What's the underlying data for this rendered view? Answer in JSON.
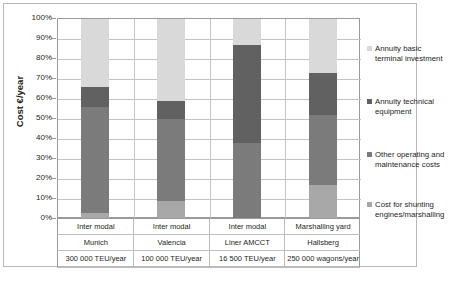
{
  "chart_data": {
    "type": "bar",
    "subtype": "stacked-percentage",
    "title": "",
    "xlabel": "",
    "ylabel": "Cost €/year",
    "ylim": [
      0,
      100
    ],
    "ytick_labels": [
      "100%",
      "90%",
      "80%",
      "70%",
      "60%",
      "50%",
      "40%",
      "30%",
      "20%",
      "10%",
      "0%"
    ],
    "ytick_values": [
      100,
      90,
      80,
      70,
      60,
      50,
      40,
      30,
      20,
      10,
      0
    ],
    "grid": true,
    "legend_position": "right",
    "categories": [
      {
        "line1": "Inter modal",
        "line2": "Munich",
        "line3": "300 000 TEU/year"
      },
      {
        "line1": "Inter modal",
        "line2": "Valencia",
        "line3": "100 000 TEU/year"
      },
      {
        "line1": "Inter modal",
        "line2": "Liner AMCCT",
        "line3": "16 500 TEU/year"
      },
      {
        "line1": "Marshalling yard",
        "line2": "Hallsberg",
        "line3": "250 000 wagons/year"
      }
    ],
    "series": [
      {
        "name": "Cost for shunting engines/marshalling",
        "color": "#b3b3b3",
        "values": [
          3,
          9,
          0,
          17
        ]
      },
      {
        "name": "Other operating and maintenance costs",
        "color": "#7f7f7f",
        "values": [
          63,
          50,
          38,
          35
        ]
      },
      {
        "name": "Annuity technical equipment",
        "color": "#595959",
        "values": [
          0,
          0,
          0,
          0
        ]
      },
      {
        "name": "Annuity basic terminal investment",
        "color": "#d9d9d9",
        "values": [
          34,
          41,
          13,
          27
        ]
      }
    ],
    "bars": [
      {
        "category": "Inter modal Munich",
        "x": 80,
        "segments": [
          {
            "label": "Annuity basic terminal investment",
            "from": 66,
            "to": 100,
            "color": "#d9d9d9"
          },
          {
            "label": "Annuity technical equipment",
            "from": 56,
            "to": 66,
            "color": "#616161"
          },
          {
            "label": "Other operating and maintenance costs",
            "from": 3,
            "to": 56,
            "color": "#7b7b7b"
          },
          {
            "label": "Cost for shunting engines/marshalling",
            "from": 0,
            "to": 3,
            "color": "#a8a8a8"
          }
        ]
      },
      {
        "category": "Inter modal Valencia",
        "x": 156,
        "segments": [
          {
            "label": "Annuity basic terminal investment",
            "from": 59,
            "to": 100,
            "color": "#d9d9d9"
          },
          {
            "label": "Annuity technical equipment",
            "from": 50,
            "to": 59,
            "color": "#616161"
          },
          {
            "label": "Other operating and maintenance costs",
            "from": 9,
            "to": 50,
            "color": "#7b7b7b"
          },
          {
            "label": "Cost for shunting engines/marshalling",
            "from": 0,
            "to": 9,
            "color": "#a8a8a8"
          }
        ]
      },
      {
        "category": "Inter modal Liner AMCCT",
        "x": 232,
        "segments": [
          {
            "label": "Annuity basic terminal investment",
            "from": 87,
            "to": 100,
            "color": "#d9d9d9"
          },
          {
            "label": "Annuity technical equipment",
            "from": 38,
            "to": 87,
            "color": "#616161"
          },
          {
            "label": "Other operating and maintenance costs",
            "from": 0,
            "to": 38,
            "color": "#7b7b7b"
          },
          {
            "label": "Cost for shunting engines/marshalling",
            "from": 0,
            "to": 0,
            "color": "#a8a8a8"
          }
        ]
      },
      {
        "category": "Marshalling yard Hallsberg",
        "x": 308,
        "segments": [
          {
            "label": "Annuity basic terminal investment",
            "from": 73,
            "to": 100,
            "color": "#d9d9d9"
          },
          {
            "label": "Annuity technical equipment",
            "from": 52,
            "to": 73,
            "color": "#616161"
          },
          {
            "label": "Other operating and maintenance costs",
            "from": 17,
            "to": 52,
            "color": "#7b7b7b"
          },
          {
            "label": "Cost for shunting engines/marshalling",
            "from": 0,
            "to": 17,
            "color": "#a8a8a8"
          }
        ]
      }
    ],
    "legend": [
      {
        "label_line1": "Annuity basic",
        "label_line2": "terminal investment",
        "color": "#d9d9d9",
        "top": 0
      },
      {
        "label_line1": "Annuity technical",
        "label_line2": "equipment",
        "color": "#616161",
        "top": 53
      },
      {
        "label_line1": "Other operating and",
        "label_line2": "maintenance costs",
        "color": "#7b7b7b",
        "top": 106
      },
      {
        "label_line1": "Cost for shunting",
        "label_line2": "engines/marshalling",
        "color": "#a8a8a8",
        "top": 156
      }
    ]
  }
}
